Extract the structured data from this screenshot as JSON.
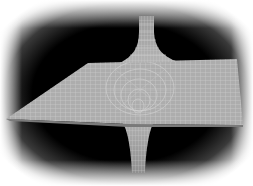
{
  "image": {
    "subject": "wormhole-embedding-diagram",
    "description": "Grey wireframe mesh surface: a flat plane in perspective with a funnel throat rising above and descending below, on a black vignetted background",
    "colors": {
      "background": "#000000",
      "vignette_edge": "#ffffff",
      "mesh_fill": "#a8a8a8",
      "mesh_fill_light": "#bdbdbd",
      "mesh_lines": "#d6d6d6"
    }
  }
}
